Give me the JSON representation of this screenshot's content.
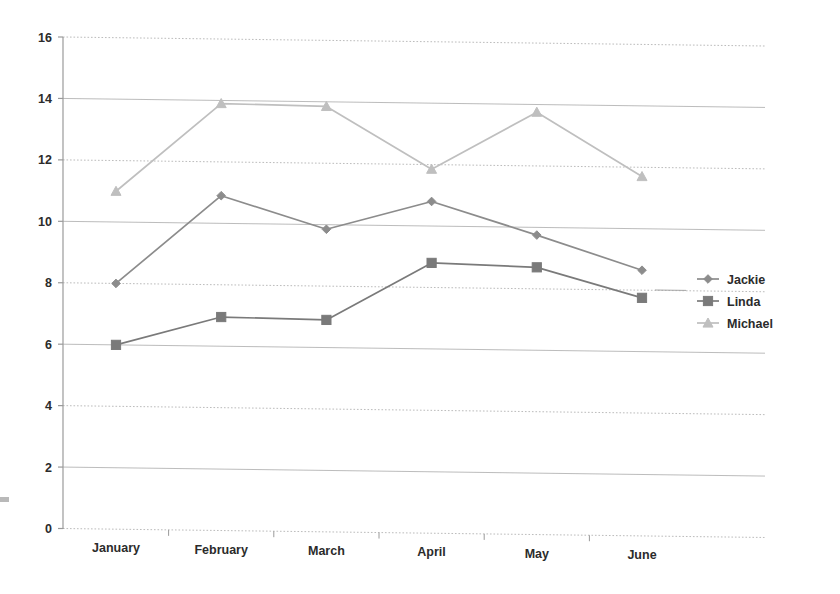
{
  "chart_data": {
    "type": "line",
    "title": "",
    "subtitle": "",
    "xlabel": "",
    "ylabel": "",
    "categories": [
      "January",
      "February",
      "March",
      "April",
      "May",
      "June"
    ],
    "ylim": [
      0,
      16
    ],
    "ytick_step": 2,
    "yticks": [
      "0",
      "2",
      "4",
      "6",
      "8",
      "10",
      "12",
      "14",
      "16"
    ],
    "grid": true,
    "grid_axis": "y",
    "legend_position": "right",
    "series": [
      {
        "name": "Jackie",
        "marker": "diamond",
        "color": "#8c8c8c",
        "values": [
          8.0,
          10.9,
          9.85,
          10.8,
          9.75,
          8.65
        ]
      },
      {
        "name": "Linda",
        "marker": "square",
        "color": "#7a7a7a",
        "values": [
          6.0,
          6.95,
          6.9,
          8.8,
          8.7,
          7.75
        ]
      },
      {
        "name": "Michael",
        "marker": "triangle",
        "color": "#bfbfbf",
        "values": [
          11.0,
          13.9,
          13.85,
          11.85,
          13.75,
          11.7
        ]
      }
    ]
  },
  "legend": {
    "entries": [
      {
        "label": "Jackie"
      },
      {
        "label": "Linda"
      },
      {
        "label": "Michael"
      }
    ]
  },
  "axes": {
    "y": {
      "ticks": [
        "16",
        "14",
        "12",
        "10",
        "8",
        "6",
        "4",
        "2",
        "0"
      ]
    },
    "x": {
      "ticks": [
        "January",
        "February",
        "March",
        "April",
        "May",
        "June"
      ]
    }
  },
  "colors": {
    "jackie": "#8c8c8c",
    "linda": "#7a7a7a",
    "michael": "#bfbfbf",
    "axis": "#9a9a9a",
    "grid": "#a8a8a8",
    "text": "#2b2b2b",
    "background": "#ffffff"
  }
}
